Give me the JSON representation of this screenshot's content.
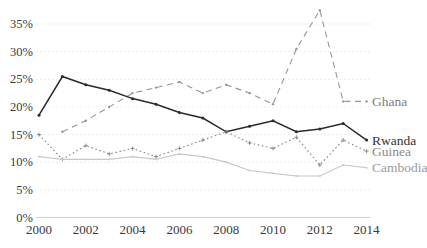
{
  "chart_data": {
    "type": "line",
    "title": "",
    "xlabel": "",
    "ylabel": "",
    "x_axis": {
      "range": [
        2000,
        2014
      ],
      "tick_years": [
        2000,
        2002,
        2004,
        2006,
        2008,
        2010,
        2012,
        2014
      ],
      "tick_labels": [
        "2000",
        "2002",
        "2004",
        "2006",
        "2008",
        "2010",
        "2012",
        "2014"
      ]
    },
    "y_axis": {
      "range_percent": [
        0,
        35
      ],
      "tick_values": [
        0,
        5,
        10,
        15,
        20,
        25,
        30,
        35
      ],
      "tick_labels": [
        "0%",
        "5%",
        "10%",
        "15%",
        "20%",
        "25%",
        "30%",
        "35%"
      ],
      "grid": true
    },
    "legend_position": "labels-at-line-ends-right",
    "series": [
      {
        "name": "Ghana",
        "style": "dashed",
        "color": "#969696",
        "label_color": "#7d7d7d",
        "x": [
          2001,
          2002,
          2003,
          2004,
          2005,
          2006,
          2007,
          2008,
          2009,
          2010,
          2011,
          2012,
          2013,
          2014
        ],
        "values": [
          15.5,
          17.5,
          20,
          22.5,
          23.5,
          24.5,
          22.5,
          24,
          22.5,
          20.5,
          30.5,
          37.5,
          21,
          21
        ]
      },
      {
        "name": "Rwanda",
        "style": "solid",
        "color": "#2a2a2a",
        "label_color": "#333333",
        "x": [
          2000,
          2001,
          2002,
          2003,
          2004,
          2005,
          2006,
          2007,
          2008,
          2009,
          2010,
          2011,
          2012,
          2013,
          2014
        ],
        "values": [
          18.5,
          25.5,
          24,
          23,
          21.5,
          20.5,
          19,
          18,
          15.5,
          16.5,
          17.5,
          15.5,
          16,
          17,
          14
        ]
      },
      {
        "name": "Guinea",
        "style": "dotted",
        "color": "#858585",
        "label_color": "#8a8a8a",
        "x": [
          2000,
          2001,
          2002,
          2003,
          2004,
          2005,
          2006,
          2007,
          2008,
          2009,
          2010,
          2011,
          2012,
          2013,
          2014
        ],
        "values": [
          15,
          10.5,
          13,
          11.5,
          12.5,
          11,
          12.5,
          14,
          15.5,
          13.5,
          12.5,
          14.5,
          9.5,
          14,
          12
        ]
      },
      {
        "name": "Cambodia",
        "style": "solid-light",
        "color": "#c8c8c8",
        "label_color": "#9a9a9a",
        "x": [
          2000,
          2001,
          2002,
          2003,
          2004,
          2005,
          2006,
          2007,
          2008,
          2009,
          2010,
          2011,
          2012,
          2013,
          2014
        ],
        "values": [
          11,
          10.5,
          10.5,
          10.5,
          11,
          10.5,
          11.5,
          11,
          10,
          8.5,
          8,
          7.5,
          7.5,
          9.5,
          9
        ]
      }
    ],
    "grid_color": "#e7e7e7",
    "axis_line_color": "#cfcfcf",
    "tick_label_color": "#3a3a3a"
  }
}
